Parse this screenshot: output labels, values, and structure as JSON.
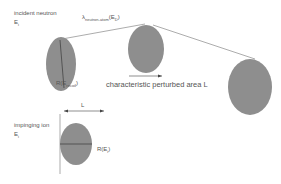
{
  "labels": {
    "incident_neutron": "incident neutron",
    "incident_energy": "E",
    "incident_energy_sub": "i",
    "lambda_main": "λ",
    "lambda_sub": "neutron-atom",
    "lambda_arg": "(E",
    "lambda_arg_sub": "D",
    "lambda_arg_close": ")",
    "r_first": "R(E",
    "r_first_sub": "recoil",
    "r_first_close": ")",
    "perturbed_area": "characteristic perturbed area L",
    "impinging_ion": "impinging ion",
    "ion_energy": "E",
    "ion_energy_sub": "i",
    "l_label": "L",
    "r_ion": "R(E",
    "r_ion_sub": "i",
    "r_ion_close": ")"
  },
  "colors": {
    "ellipse_fill": "#8c8c8c",
    "line": "#777777",
    "text": "#555555"
  }
}
